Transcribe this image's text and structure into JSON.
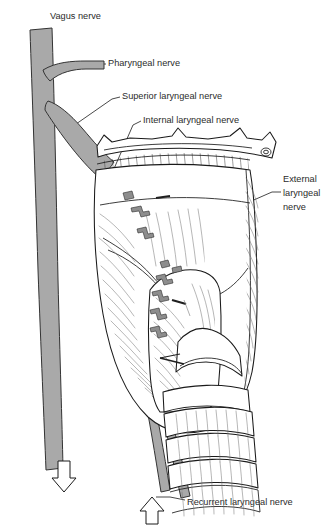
{
  "figure": {
    "background_color": "#ffffff",
    "width": 333,
    "height": 530,
    "labels": {
      "vagus_nerve": "Vagus nerve",
      "pharyngeal_nerve": "Pharyngeal nerve",
      "superior_laryngeal_nerve": "Superior laryngeal nerve",
      "internal_laryngeal_nerve": "Internal laryngeal nerve",
      "external_laryngeal_nerve_line1": "External",
      "external_laryngeal_nerve_line2": "laryngeal",
      "external_laryngeal_nerve_line3": "nerve",
      "recurrent_laryngeal_nerve": "Recurrent laryngeal nerve"
    },
    "colors": {
      "nerve_gray": "#a9a9a9",
      "outline_black": "#1a1a1a",
      "hatch_gray": "#4a4a4a",
      "text_color": "#2b2b2b",
      "paper_white": "#ffffff"
    },
    "icons": {
      "down_arrow": "down-arrow-icon",
      "up_arrow": "up-arrow-icon"
    },
    "structures": {
      "hyoid_bone": "hyoid-bone",
      "thyrohyoid_membrane": "thyrohyoid-membrane",
      "thyroid_cartilage": "thyroid-cartilage",
      "cricothyroid_muscle": "cricothyroid-muscle",
      "cricoid_cartilage": "cricoid-cartilage",
      "tracheal_rings": "tracheal-rings"
    }
  }
}
